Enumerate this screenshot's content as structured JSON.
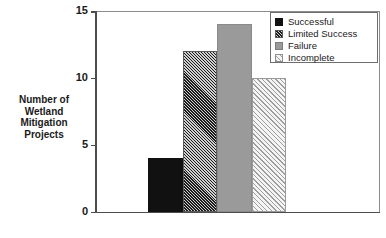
{
  "chart_data": {
    "type": "bar",
    "title": "",
    "xlabel": "",
    "ylabel": "Number of Wetland Mitigation Projects",
    "ylabel_lines": [
      "Number of",
      "Wetland",
      "Mitigation",
      "Projects"
    ],
    "categories": [
      "Successful",
      "Limited Success",
      "Failure",
      "Incomplete"
    ],
    "values": [
      4,
      12,
      14,
      10
    ],
    "ylim": [
      0,
      15
    ],
    "yticks": [
      0,
      5,
      10,
      15
    ],
    "ytick_labels": [
      "0",
      "5",
      "10",
      "15"
    ],
    "grid": false,
    "legend_position": "top-right",
    "legend_entries": [
      {
        "label": "Successful",
        "fill": "solid-black",
        "value": 4
      },
      {
        "label": "Limited Success",
        "fill": "hatch-dark",
        "value": 12
      },
      {
        "label": "Failure",
        "fill": "solid-gray",
        "value": 14
      },
      {
        "label": "Incomplete",
        "fill": "hatch-light",
        "value": 10
      }
    ],
    "colors": {
      "solid_black": "#111111",
      "solid_gray": "#9a9a9a",
      "hatch_dark_line": "#1c1c1c",
      "hatch_dark_ground": "#cfcfcf",
      "hatch_light_line": "#9e9e9e",
      "hatch_light_ground": "#f4f4f4",
      "axis": "#4d4d4d",
      "frame": "#8c8c8c",
      "text": "#1a1a1a",
      "background": "#ffffff"
    }
  }
}
